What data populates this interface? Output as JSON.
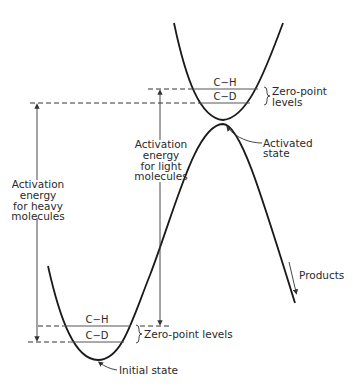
{
  "diagram": {
    "type": "potential-energy-curve",
    "colors": {
      "curve": "#1a1a1a",
      "line": "#333333",
      "text": "#2a2a2a",
      "background": "#ffffff"
    },
    "labels": {
      "top_ch": "C−H",
      "top_cd": "C−D",
      "top_zero_point_line1": "Zero-point",
      "top_zero_point_line2": "levels",
      "activated_state_line1": "Activated",
      "activated_state_line2": "state",
      "light_line1": "Activation",
      "light_line2": "energy",
      "light_line3": "for light",
      "light_line4": "molecules",
      "heavy_line1": "Activation",
      "heavy_line2": "energy",
      "heavy_line3": "for heavy",
      "heavy_line4": "molecules",
      "products": "Products",
      "bottom_ch": "C−H",
      "bottom_cd": "C−D",
      "bottom_zero_point": "Zero-point levels",
      "initial_state": "Initial state"
    }
  }
}
